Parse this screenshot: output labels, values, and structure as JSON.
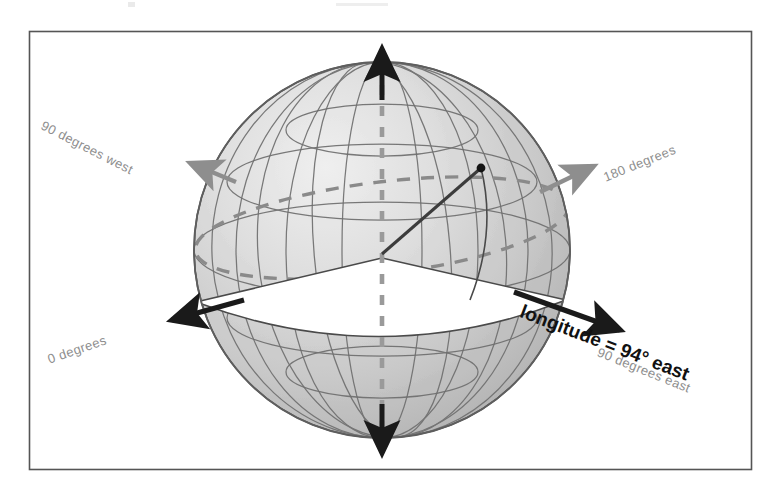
{
  "figure": {
    "type": "diagram",
    "frame": {
      "stroke": "#555555"
    },
    "background": "#ffffff"
  },
  "sphere": {
    "name": "globe",
    "fill": "#c9c9c9",
    "grid_color": "#6f6f6f",
    "dashed_color": "#8a8a8a",
    "center_x": 382,
    "center_y": 250,
    "radius": 188
  },
  "axis": {
    "name": "polar-axis",
    "color": "#1a1a1a",
    "dashed_color": "#9a9a9a",
    "top_arrow_label": "",
    "bottom_arrow_label": ""
  },
  "point": {
    "name": "surface-point",
    "color": "#1a1a1a"
  },
  "labels": [
    {
      "id": "west-90",
      "text": "90 degrees west",
      "style": "gray",
      "x": 42,
      "y": 117,
      "rotate": 27,
      "arrow": "gray"
    },
    {
      "id": "east-180",
      "text": "180 degrees",
      "style": "gray",
      "x": 604,
      "y": 170,
      "rotate": -22,
      "arrow": "gray"
    },
    {
      "id": "zero",
      "text": "0 degrees",
      "style": "gray",
      "x": 48,
      "y": 352,
      "rotate": -19,
      "arrow": "black"
    },
    {
      "id": "east-90",
      "text": "90 degrees east",
      "style": "gray",
      "x": 598,
      "y": 344,
      "rotate": 22,
      "arrow": "black"
    },
    {
      "id": "longitude-value",
      "text": "longitude = 94° east",
      "style": "bold",
      "x": 521,
      "y": 300,
      "rotate": 21,
      "arrow": "black"
    }
  ],
  "colors": {
    "sphere_fill": "#c9c9c9",
    "sphere_light": "#e3e3e3",
    "grid": "#6f6f6f",
    "gray_arrow": "#8e8e8e",
    "black_arrow": "#1a1a1a",
    "label_gray": "#8e8e8e",
    "label_black": "#111111",
    "frame": "#555555"
  }
}
